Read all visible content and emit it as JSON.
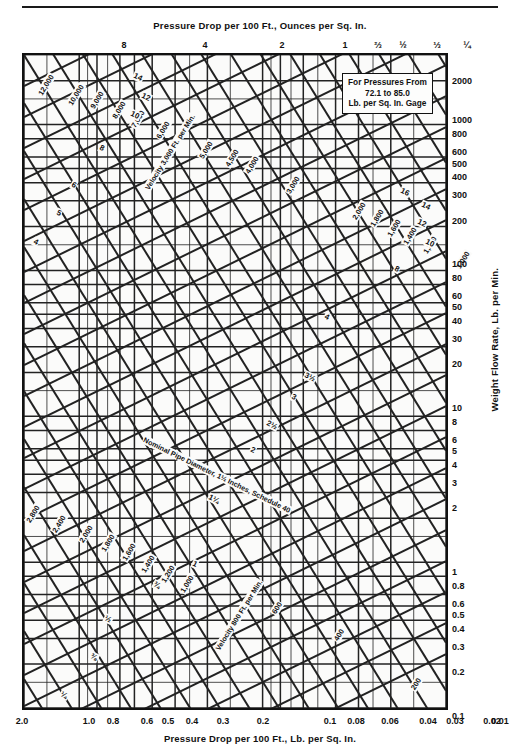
{
  "chart_data": {
    "type": "line",
    "subtitle": "Pressure drop vs weight flow rate for schedule 40 pipe",
    "xlabel_top": "Pressure Drop per 100 Ft., Ounces per Sq. In.",
    "xlabel_bottom": "Pressure Drop per 100 Ft., Lb. per Sq. In.",
    "ylabel_right": "Weight Flow Rate, Lb. per Min.",
    "note": {
      "line1": "For Pressures From",
      "line2": "72.1 to 85.0",
      "line3": "Lb. per Sq. In. Gage"
    },
    "grid": true,
    "log_scale": true,
    "legend_position": "none",
    "xlim_bottom": [
      0.01,
      2.0
    ],
    "ylim_right": [
      0.1,
      3000
    ],
    "xticks_top": [
      "8",
      "4",
      "2",
      "1",
      "⅔",
      "½",
      "⅓",
      "¼"
    ],
    "xticks_top_values": [
      8,
      4,
      2,
      1,
      0.6667,
      0.5,
      0.3333,
      0.25
    ],
    "xticks_bottom": [
      "2.0",
      "1.0",
      "0.8",
      "0.6",
      "0.5",
      "0.4",
      "0.3",
      "0.2",
      "0.1",
      "0.08",
      "0.06",
      "0.04",
      "0.03",
      "0.02",
      "0.01"
    ],
    "xticks_bottom_values": [
      2.0,
      1.0,
      0.8,
      0.6,
      0.5,
      0.4,
      0.3,
      0.2,
      0.1,
      0.08,
      0.06,
      0.04,
      0.03,
      0.02,
      0.01
    ],
    "yticks_right": [
      "2000",
      "1000",
      "800",
      "600",
      "500",
      "400",
      "300",
      "200",
      "100",
      "80",
      "60",
      "50",
      "40",
      "30",
      "20",
      "10",
      "8",
      "6",
      "5",
      "4",
      "3",
      "2",
      "1",
      "0.8",
      "0.6",
      "0.5",
      "0.4",
      "0.3",
      "0.2",
      "0.1"
    ],
    "yticks_right_values": [
      2000,
      1000,
      800,
      600,
      500,
      400,
      300,
      200,
      100,
      80,
      60,
      50,
      40,
      30,
      20,
      10,
      8,
      6,
      5,
      4,
      3,
      2,
      1,
      0.8,
      0.6,
      0.5,
      0.4,
      0.3,
      0.2,
      0.1
    ],
    "series": [
      {
        "name": "Nominal Pipe Diameter, Schedule 40 (inches)",
        "kind": "pipe-size-lines",
        "slope_direction": "rising-left-to-right",
        "labels": [
          "16",
          "14",
          "12",
          "10",
          "8",
          "6",
          "5",
          "4",
          "3½",
          "3",
          "2½",
          "2",
          "1½",
          "1¼",
          "1",
          "¾",
          "½",
          "⅜",
          "¼"
        ]
      },
      {
        "name": "Velocity, Ft. per Min.",
        "kind": "velocity-lines",
        "slope_direction": "falling-left-to-right",
        "labels": [
          "12,000",
          "10,000",
          "9,000",
          "8,000",
          "7,000",
          "6,000",
          "5,000",
          "4,500",
          "4,000",
          "3,000",
          "2,800",
          "2,400",
          "2,000",
          "1,800",
          "1,600",
          "1,400",
          "1,200",
          "1,000",
          "800",
          "600",
          "400",
          "200"
        ],
        "values": [
          12000,
          10000,
          9000,
          8000,
          7000,
          6000,
          5000,
          4500,
          4000,
          3000,
          2800,
          2400,
          2000,
          1800,
          1600,
          1400,
          1200,
          1000,
          800,
          600,
          400,
          200
        ]
      }
    ],
    "annotations": [
      {
        "text": "Velocity 3,000 Ft. per Min.",
        "kind": "velocity-family-label"
      },
      {
        "text": "Nominal Pipe Diameter, 1½ Inches, Schedule 40",
        "kind": "pipe-family-label"
      },
      {
        "text": "Velocity 800 Ft. per Min.",
        "kind": "velocity-family-label"
      }
    ]
  },
  "axes": {
    "top": {
      "title": "Pressure Drop per 100 Ft., Ounces per Sq. In.",
      "ticks": [
        {
          "label": "8",
          "x": 124
        },
        {
          "label": "4",
          "x": 205
        },
        {
          "label": "2",
          "x": 282
        },
        {
          "label": "1",
          "x": 345
        },
        {
          "label": "⅔",
          "x": 378
        },
        {
          "label": "½",
          "x": 403
        },
        {
          "label": "⅓",
          "x": 437
        },
        {
          "label": "¼",
          "x": 467
        }
      ]
    },
    "bottom": {
      "title": "Pressure Drop per 100 Ft., Lb. per Sq. In.",
      "ticks": [
        {
          "label": "2.0",
          "x": 22
        },
        {
          "label": "1.0",
          "x": 89
        },
        {
          "label": "0.8",
          "x": 113
        },
        {
          "label": "0.6",
          "x": 147
        },
        {
          "label": "0.5",
          "x": 168
        },
        {
          "label": "0.4",
          "x": 192
        },
        {
          "label": "0.3",
          "x": 223
        },
        {
          "label": "0.2",
          "x": 263
        },
        {
          "label": "0.1",
          "x": 330
        },
        {
          "label": "0.08",
          "x": 356
        },
        {
          "label": "0.06",
          "x": 390
        },
        {
          "label": "0.04",
          "x": 428
        },
        {
          "label": "0.03",
          "x": 455
        },
        {
          "label": "0.02",
          "x": 492
        },
        {
          "label": "0.01",
          "x": 558
        }
      ]
    },
    "right": {
      "title": "Weight Flow Rate, Lb. per Min.",
      "ticks": [
        {
          "label": "2000",
          "y": 82
        },
        {
          "label": "1000",
          "y": 121
        },
        {
          "label": "800",
          "y": 135
        },
        {
          "label": "600",
          "y": 153
        },
        {
          "label": "500",
          "y": 165
        },
        {
          "label": "400",
          "y": 178
        },
        {
          "label": "300",
          "y": 196
        },
        {
          "label": "200",
          "y": 222
        },
        {
          "label": "100",
          "y": 265
        },
        {
          "label": "80",
          "y": 279
        },
        {
          "label": "60",
          "y": 297
        },
        {
          "label": "50",
          "y": 308
        },
        {
          "label": "40",
          "y": 322
        },
        {
          "label": "30",
          "y": 340
        },
        {
          "label": "20",
          "y": 365
        },
        {
          "label": "10",
          "y": 409
        },
        {
          "label": "8",
          "y": 423
        },
        {
          "label": "6",
          "y": 441
        },
        {
          "label": "5",
          "y": 452
        },
        {
          "label": "4",
          "y": 466
        },
        {
          "label": "3",
          "y": 484
        },
        {
          "label": "2",
          "y": 509
        },
        {
          "label": "1",
          "y": 573
        },
        {
          "label": "0.8",
          "y": 587
        },
        {
          "label": "0.6",
          "y": 605
        },
        {
          "label": "0.5",
          "y": 616
        },
        {
          "label": "0.4",
          "y": 630
        },
        {
          "label": "0.3",
          "y": 648
        },
        {
          "label": "0.2",
          "y": 673
        },
        {
          "label": "0.1",
          "y": 717
        }
      ]
    }
  },
  "note_box": {
    "line1": "For Pressures From",
    "line2": "72.1 to 85.0",
    "line3": "Lb. per Sq. In. Gage"
  },
  "curve_labels": [
    {
      "text": "12,000",
      "x": 44,
      "y": 83,
      "rot": -58,
      "kind": "velocity"
    },
    {
      "text": "10,000",
      "x": 74,
      "y": 93,
      "rot": -58,
      "kind": "velocity"
    },
    {
      "text": "9,000",
      "x": 95,
      "y": 98,
      "rot": -58,
      "kind": "velocity"
    },
    {
      "text": "8,000",
      "x": 117,
      "y": 108,
      "rot": -58,
      "kind": "velocity"
    },
    {
      "text": "7,000",
      "x": 136,
      "y": 117,
      "rot": -58,
      "kind": "velocity"
    },
    {
      "text": "6,000",
      "x": 161,
      "y": 128,
      "rot": -58,
      "kind": "velocity"
    },
    {
      "text": "5,000",
      "x": 204,
      "y": 148,
      "rot": -58,
      "kind": "velocity"
    },
    {
      "text": "4,500",
      "x": 230,
      "y": 156,
      "rot": -58,
      "kind": "velocity"
    },
    {
      "text": "4,000",
      "x": 250,
      "y": 163,
      "rot": -58,
      "kind": "velocity"
    },
    {
      "text": "3,000",
      "x": 291,
      "y": 183,
      "rot": -58,
      "kind": "velocity"
    },
    {
      "text": "2,000",
      "x": 357,
      "y": 209,
      "rot": -58,
      "kind": "velocity"
    },
    {
      "text": "1,800",
      "x": 375,
      "y": 216,
      "rot": -58,
      "kind": "velocity"
    },
    {
      "text": "1,600",
      "x": 392,
      "y": 226,
      "rot": -58,
      "kind": "velocity"
    },
    {
      "text": "1,400",
      "x": 408,
      "y": 234,
      "rot": -58,
      "kind": "velocity"
    },
    {
      "text": "1,200",
      "x": 428,
      "y": 243,
      "rot": -58,
      "kind": "velocity"
    },
    {
      "text": "1,000",
      "x": 461,
      "y": 258,
      "rot": -58,
      "kind": "velocity"
    },
    {
      "text": "2,800",
      "x": 31,
      "y": 512,
      "rot": -58,
      "kind": "velocity"
    },
    {
      "text": "2,400",
      "x": 57,
      "y": 522,
      "rot": -58,
      "kind": "velocity"
    },
    {
      "text": "2,000",
      "x": 84,
      "y": 532,
      "rot": -58,
      "kind": "velocity"
    },
    {
      "text": "1,800",
      "x": 106,
      "y": 541,
      "rot": -58,
      "kind": "velocity"
    },
    {
      "text": "1,600",
      "x": 127,
      "y": 550,
      "rot": -58,
      "kind": "velocity"
    },
    {
      "text": "1,400",
      "x": 146,
      "y": 562,
      "rot": -58,
      "kind": "velocity"
    },
    {
      "text": "1,200",
      "x": 166,
      "y": 572,
      "rot": -58,
      "kind": "velocity"
    },
    {
      "text": "1,000",
      "x": 185,
      "y": 582,
      "rot": -58,
      "kind": "velocity"
    },
    {
      "text": "600",
      "x": 275,
      "y": 606,
      "rot": -58,
      "kind": "velocity"
    },
    {
      "text": "400",
      "x": 337,
      "y": 633,
      "rot": -58,
      "kind": "velocity"
    },
    {
      "text": "200",
      "x": 414,
      "y": 682,
      "rot": -58,
      "kind": "velocity"
    },
    {
      "text": "Velocity 3,000 Ft. per Min.",
      "x": 168,
      "y": 150,
      "rot": -58,
      "kind": "velocity-title"
    },
    {
      "text": "Velocity 800 Ft. per Min.",
      "x": 237,
      "y": 613,
      "rot": -58,
      "kind": "velocity-title"
    },
    {
      "text": "Nominal Pipe Diameter, 1½ Inches, Schedule 40",
      "x": 215,
      "y": 473,
      "rot": 26,
      "kind": "pipe-title"
    },
    {
      "text": "16",
      "x": 403,
      "y": 190,
      "rot": 26,
      "kind": "pipe"
    },
    {
      "text": "14",
      "x": 424,
      "y": 204,
      "rot": 26,
      "kind": "pipe"
    },
    {
      "text": "12",
      "x": 420,
      "y": 221,
      "rot": 26,
      "kind": "pipe"
    },
    {
      "text": "10",
      "x": 428,
      "y": 241,
      "rot": 26,
      "kind": "pipe"
    },
    {
      "text": "8",
      "x": 395,
      "y": 267,
      "rot": 26,
      "kind": "pipe"
    },
    {
      "text": "14",
      "x": 136,
      "y": 75,
      "rot": 26,
      "kind": "pipe"
    },
    {
      "text": "12",
      "x": 144,
      "y": 95,
      "rot": 26,
      "kind": "pipe"
    },
    {
      "text": "10",
      "x": 133,
      "y": 113,
      "rot": 26,
      "kind": "pipe"
    },
    {
      "text": "8",
      "x": 100,
      "y": 146,
      "rot": 26,
      "kind": "pipe"
    },
    {
      "text": "6",
      "x": 72,
      "y": 183,
      "rot": 26,
      "kind": "pipe"
    },
    {
      "text": "5",
      "x": 57,
      "y": 211,
      "rot": 26,
      "kind": "pipe"
    },
    {
      "text": "4",
      "x": 34,
      "y": 240,
      "rot": 26,
      "kind": "pipe"
    },
    {
      "text": "4",
      "x": 325,
      "y": 315,
      "rot": 26,
      "kind": "pipe"
    },
    {
      "text": "3½",
      "x": 308,
      "y": 375,
      "rot": 26,
      "kind": "pipe"
    },
    {
      "text": "3",
      "x": 292,
      "y": 395,
      "rot": 26,
      "kind": "pipe"
    },
    {
      "text": "2½",
      "x": 270,
      "y": 423,
      "rot": 26,
      "kind": "pipe"
    },
    {
      "text": "2",
      "x": 251,
      "y": 448,
      "rot": 26,
      "kind": "pipe"
    },
    {
      "text": "1¼",
      "x": 212,
      "y": 497,
      "rot": 26,
      "kind": "pipe"
    },
    {
      "text": "1",
      "x": 193,
      "y": 562,
      "rot": 26,
      "kind": "pipe"
    },
    {
      "text": "¾",
      "x": 155,
      "y": 583,
      "rot": 26,
      "kind": "pipe"
    },
    {
      "text": "½",
      "x": 106,
      "y": 617,
      "rot": 26,
      "kind": "pipe"
    },
    {
      "text": "⅜",
      "x": 92,
      "y": 655,
      "rot": 26,
      "kind": "pipe"
    },
    {
      "text": "¼",
      "x": 62,
      "y": 693,
      "rot": 26,
      "kind": "pipe"
    }
  ]
}
